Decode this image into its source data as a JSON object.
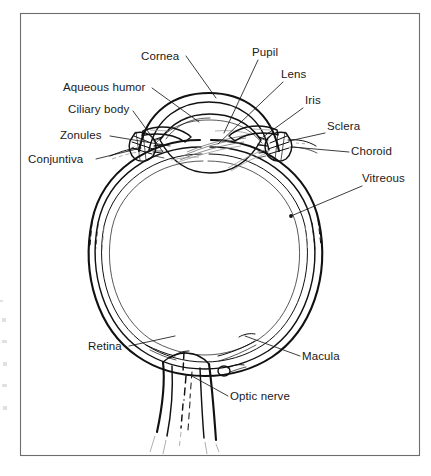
{
  "figure": {
    "kind": "anatomical-line-diagram",
    "style": "black-and-white scanned line art",
    "frame": {
      "x": 20,
      "y": 13,
      "width": 400,
      "height": 443
    },
    "colors": {
      "ink": "#111111",
      "background": "#ffffff",
      "frame_border": "#6d6d6d",
      "faint_detail": "#9a9a9a"
    }
  },
  "labels": [
    {
      "id": "cornea",
      "text": "Cornea",
      "text_x": 141,
      "text_y": 60,
      "anchor": "start",
      "leader": [
        [
          186,
          56
        ],
        [
          216,
          98
        ]
      ]
    },
    {
      "id": "pupil",
      "text": "Pupil",
      "text_x": 252,
      "text_y": 56,
      "anchor": "start",
      "leader": [
        [
          258,
          60
        ],
        [
          224,
          133
        ]
      ]
    },
    {
      "id": "lens",
      "text": "Lens",
      "text_x": 281,
      "text_y": 78,
      "anchor": "start",
      "leader": [
        [
          283,
          82
        ],
        [
          218,
          144
        ]
      ]
    },
    {
      "id": "iris",
      "text": "Iris",
      "text_x": 305,
      "text_y": 104,
      "anchor": "start",
      "leader": [
        [
          303,
          108
        ],
        [
          263,
          137
        ]
      ]
    },
    {
      "id": "sclera",
      "text": "Sclera",
      "text_x": 327,
      "text_y": 130,
      "anchor": "start",
      "leader": [
        [
          325,
          133
        ],
        [
          289,
          141
        ]
      ]
    },
    {
      "id": "choroid",
      "text": "Choroid",
      "text_x": 351,
      "text_y": 155,
      "anchor": "start",
      "leader": [
        [
          349,
          152
        ],
        [
          292,
          147
        ]
      ]
    },
    {
      "id": "vitreous",
      "text": "Vitreous",
      "text_x": 362,
      "text_y": 182,
      "anchor": "start",
      "leader": [
        [
          362,
          186
        ],
        [
          291,
          216
        ]
      ]
    },
    {
      "id": "aqueous-humor",
      "text": "Aqueous humor",
      "text_x": 63,
      "text_y": 91,
      "anchor": "start",
      "leader": [
        [
          152,
          88
        ],
        [
          199,
          122
        ]
      ]
    },
    {
      "id": "ciliary-body",
      "text": "Ciliary body",
      "text_x": 68,
      "text_y": 113,
      "anchor": "start",
      "leader": [
        [
          133,
          111
        ],
        [
          163,
          152
        ]
      ]
    },
    {
      "id": "zonules",
      "text": "Zonules",
      "text_x": 60,
      "text_y": 139,
      "anchor": "start",
      "leader": [
        [
          110,
          136
        ],
        [
          170,
          146
        ]
      ]
    },
    {
      "id": "conjuntiva",
      "text": "Conjuntiva",
      "text_x": 28,
      "text_y": 163,
      "anchor": "start",
      "leader": [
        [
          96,
          159
        ],
        [
          137,
          149
        ]
      ]
    },
    {
      "id": "retina",
      "text": "Retina",
      "text_x": 88,
      "text_y": 350,
      "anchor": "start",
      "leader": [
        [
          129,
          346
        ],
        [
          175,
          336
        ]
      ]
    },
    {
      "id": "macula",
      "text": "Macula",
      "text_x": 302,
      "text_y": 360,
      "anchor": "start",
      "leader": [
        [
          300,
          356
        ],
        [
          245,
          336
        ]
      ]
    },
    {
      "id": "optic-nerve",
      "text": "Optic nerve",
      "text_x": 230,
      "text_y": 400,
      "anchor": "start",
      "leader": [
        [
          228,
          396
        ],
        [
          190,
          375
        ]
      ]
    }
  ]
}
